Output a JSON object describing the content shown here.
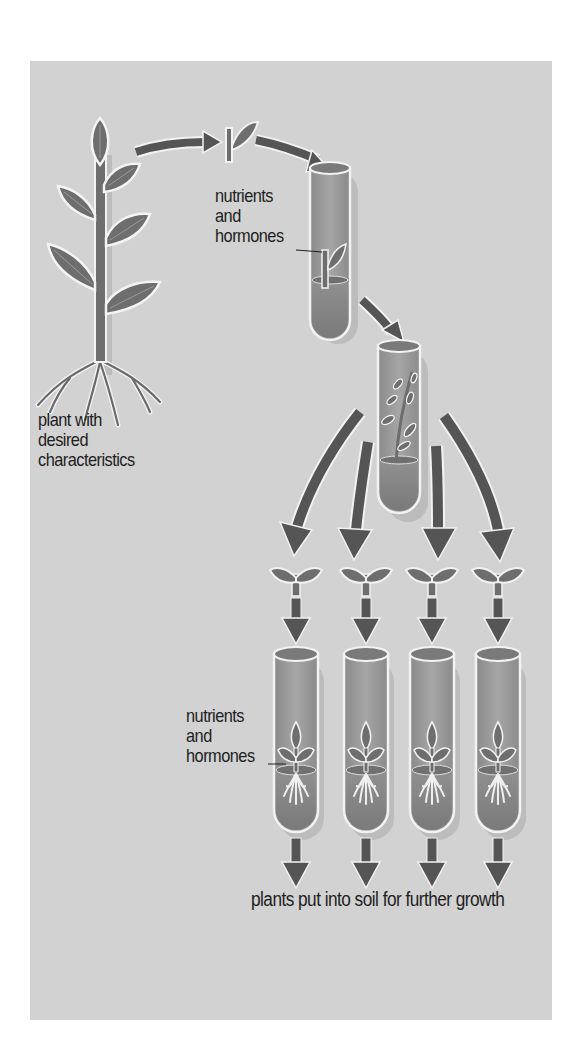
{
  "diagram": {
    "colors": {
      "background": "#ffffff",
      "panel": "#d2d2d2",
      "arrow": "#555555",
      "leaf": "#6e6e6e",
      "leaf_outline": "#f4f4f4",
      "tube_glass": "#9a9a9a",
      "tube_medium": "#848484",
      "shadow": "#bcbcbc",
      "text": "#1e1e1e"
    },
    "labels": {
      "parent_plant": [
        "plant with",
        "desired",
        "characteristics"
      ],
      "nutrients_top": [
        "nutrients",
        "and",
        "hormones"
      ],
      "nutrients_bottom": [
        "nutrients",
        "and",
        "hormones"
      ],
      "final_step": "plants put into soil for further growth"
    },
    "stages": [
      {
        "id": "parent-plant",
        "label": "plant with desired characteristics"
      },
      {
        "id": "cutting",
        "label": "small cutting taken"
      },
      {
        "id": "culture-tube",
        "label": "cutting grown in nutrients and hormones"
      },
      {
        "id": "plantlet-tube",
        "label": "plantlet grows in tube"
      },
      {
        "id": "plantlets",
        "count": 4,
        "label": "plantlet pieces separated"
      },
      {
        "id": "rooting-tubes",
        "count": 4,
        "label": "plantlets root in nutrients and hormones"
      },
      {
        "id": "soil",
        "label": "plants put into soil for further growth"
      }
    ],
    "edges": [
      {
        "from": "parent-plant",
        "to": "cutting"
      },
      {
        "from": "cutting",
        "to": "culture-tube"
      },
      {
        "from": "culture-tube",
        "to": "plantlet-tube"
      },
      {
        "from": "plantlet-tube",
        "to": "plantlets",
        "count": 4
      },
      {
        "from": "plantlets",
        "to": "rooting-tubes",
        "count": 4
      },
      {
        "from": "rooting-tubes",
        "to": "soil",
        "count": 4
      }
    ]
  }
}
